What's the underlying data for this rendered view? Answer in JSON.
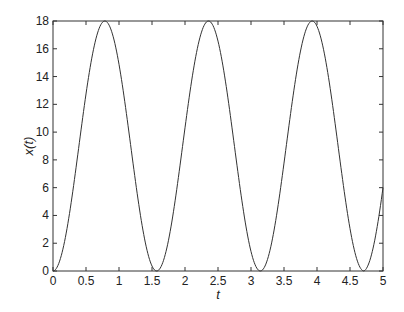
{
  "chart_data": {
    "type": "line",
    "title": "",
    "xlabel": "t",
    "ylabel": "x(t)",
    "xlim": [
      0,
      5
    ],
    "ylim": [
      0,
      18
    ],
    "grid": false,
    "legend": null,
    "xticks": [
      "0",
      "0.5",
      "1",
      "1.5",
      "2",
      "2.5",
      "3",
      "3.5",
      "4",
      "4.5",
      "5"
    ],
    "yticks": [
      "0",
      "2",
      "4",
      "6",
      "8",
      "10",
      "12",
      "14",
      "16",
      "18"
    ],
    "series": [
      {
        "name": "x(t)",
        "color": "#333333",
        "description": "periodic oscillation, approx 9*(1 - cos(4t))",
        "x": [
          0,
          0.25,
          0.5,
          0.785,
          1.0,
          1.25,
          1.571,
          1.8,
          2.0,
          2.356,
          2.6,
          2.8,
          3.142,
          3.4,
          3.6,
          3.927,
          4.2,
          4.4,
          4.712,
          5.0
        ],
        "y": [
          0,
          4.1,
          12.7,
          18.0,
          14.9,
          6.4,
          0,
          5.7,
          10.3,
          18.0,
          10.2,
          4.1,
          0,
          4.6,
          12.8,
          18.0,
          10.6,
          2.3,
          0,
          6.0
        ]
      }
    ]
  }
}
